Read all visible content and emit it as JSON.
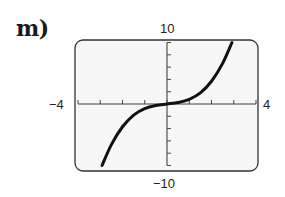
{
  "problem": {
    "label": "m)"
  },
  "chart_data": {
    "type": "line",
    "title": "",
    "xlabel": "",
    "ylabel": "",
    "xlim": [
      -4,
      4
    ],
    "ylim": [
      -10,
      10
    ],
    "x_tick_step": 1,
    "y_tick_step": 2,
    "grid": false,
    "window_labels": {
      "xmin": "−4",
      "xmax": "4",
      "ymin": "−10",
      "ymax": "10"
    },
    "series": [
      {
        "name": "curve",
        "description": "cubic-shaped curve through origin, approx y = 0.36x^3 + 0.4x",
        "x": [
          -2.92,
          -2.5,
          -2.0,
          -1.5,
          -1.0,
          -0.5,
          0,
          0.5,
          1.0,
          1.5,
          2.0,
          2.5,
          2.92
        ],
        "y": [
          -10.0,
          -6.6,
          -3.7,
          -1.8,
          -0.76,
          -0.25,
          0,
          0.25,
          0.76,
          1.8,
          3.7,
          6.6,
          10.0
        ]
      }
    ]
  },
  "frame": {
    "x": 75,
    "y": 40,
    "width": 183,
    "height": 131,
    "radius": 8
  },
  "axes": {
    "origin_px": [
      167,
      104
    ],
    "px_per_x": 22.25,
    "px_per_y": 6.15
  },
  "colors": {
    "curve": "#111111",
    "frame": "#333333",
    "axis": "#444444",
    "background": "#f7f7f7"
  }
}
